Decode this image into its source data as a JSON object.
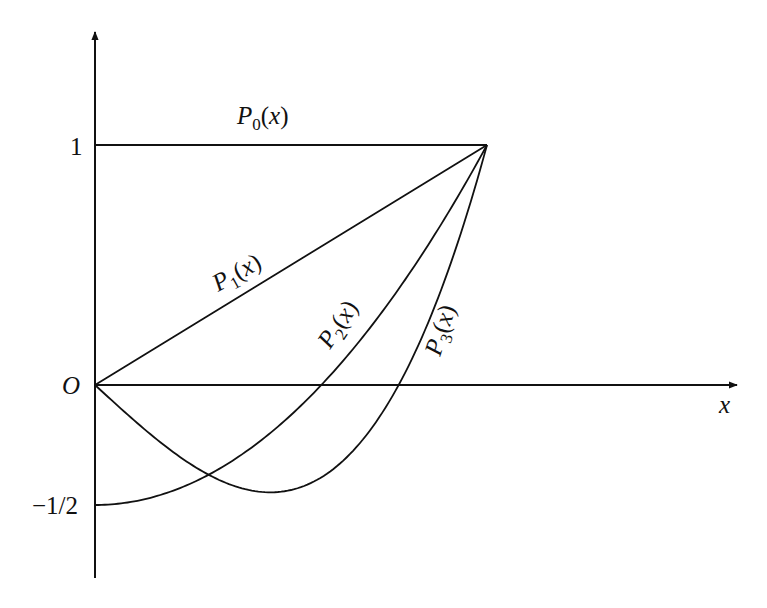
{
  "chart_data": {
    "type": "line",
    "title": "",
    "xlabel": "x",
    "ylabel": "",
    "origin_label": "O",
    "xlim": [
      0,
      1
    ],
    "ylim": [
      -0.5,
      1
    ],
    "grid": false,
    "legend": "inline labels along curves",
    "y_ticks": [
      {
        "value": 1,
        "label": "1"
      },
      {
        "value": -0.5,
        "label": "−1/2"
      }
    ],
    "series": [
      {
        "name": "P0(x)",
        "base": "P",
        "index": "0",
        "formula": "1",
        "x": [
          0,
          0.25,
          0.5,
          0.75,
          1
        ],
        "values": [
          1,
          1,
          1,
          1,
          1
        ]
      },
      {
        "name": "P1(x)",
        "base": "P",
        "index": "1",
        "formula": "x",
        "x": [
          0,
          0.25,
          0.5,
          0.75,
          1
        ],
        "values": [
          0,
          0.25,
          0.5,
          0.75,
          1
        ]
      },
      {
        "name": "P2(x)",
        "base": "P",
        "index": "2",
        "formula": "(3x^2-1)/2",
        "x": [
          0,
          0.25,
          0.5,
          0.577,
          0.75,
          1
        ],
        "values": [
          -0.5,
          -0.406,
          -0.125,
          0,
          0.344,
          1
        ]
      },
      {
        "name": "P3(x)",
        "base": "P",
        "index": "3",
        "formula": "(5x^3-3x)/2",
        "x": [
          0,
          0.25,
          0.447,
          0.5,
          0.775,
          1
        ],
        "values": [
          0,
          -0.336,
          -0.447,
          -0.438,
          0,
          1
        ]
      }
    ],
    "annotations": [
      {
        "text": "P0(x)",
        "near": "horizontal line y=1"
      },
      {
        "text": "P1(x)",
        "near": "straight line"
      },
      {
        "text": "P2(x)",
        "near": "parabola"
      },
      {
        "text": "P3(x)",
        "near": "cubic"
      }
    ]
  }
}
